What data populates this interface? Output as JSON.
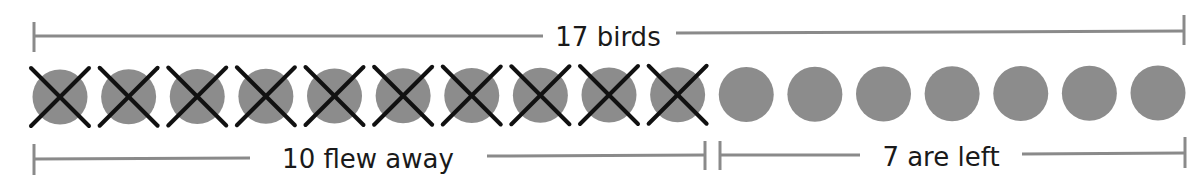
{
  "diagram": {
    "title": "17 birds",
    "total_label": "17 birds",
    "removed_label": "10 flew away",
    "remaining_label": "7 are left",
    "total_count": 17,
    "removed_count": 10,
    "remaining_count": 7,
    "colors": {
      "circle": "#8c8c8c",
      "cross": "#111111",
      "bracket": "#8a8a8a",
      "text": "#1a1a1a"
    }
  }
}
